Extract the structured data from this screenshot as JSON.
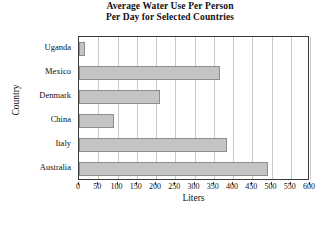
{
  "chart_data": {
    "type": "bar",
    "orientation": "horizontal",
    "title": "Average Water Use Per Person Per Day for Selected Countries",
    "title_lines": [
      "Average Water Use Per Person",
      "Per Day for Selected Countries"
    ],
    "xlabel": "Liters",
    "ylabel": "Country",
    "categories": [
      "Uganda",
      "Mexico",
      "Denmark",
      "China",
      "Italy",
      "Australia"
    ],
    "values": [
      15,
      365,
      210,
      90,
      385,
      490
    ],
    "xlim": [
      0,
      600
    ],
    "xticks": [
      0,
      50,
      100,
      150,
      200,
      250,
      300,
      350,
      400,
      450,
      500,
      550,
      600
    ],
    "xtick_labels": [
      "0",
      "50",
      "100",
      "150",
      "200",
      "250",
      "300",
      "350",
      "400",
      "450",
      "500",
      "550",
      "600"
    ],
    "grid": "vertical",
    "legend": "none",
    "bar_color": "#c4c4c4",
    "bar_edge_color": "#8d8d8d",
    "axis_color": "#3a3a3a",
    "grid_color": "#c8c8c8",
    "background": "#ffffff"
  }
}
